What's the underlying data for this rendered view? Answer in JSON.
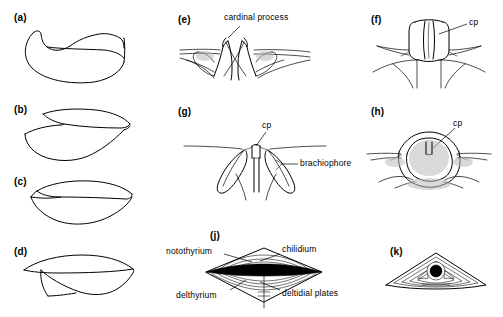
{
  "figure": {
    "domain": "scientific-line-illustration",
    "background_color": "#ffffff",
    "line_color": "#000000",
    "width": 503,
    "height": 317
  },
  "panels": [
    {
      "id": "a",
      "letter": "(a)",
      "description": "Lateral profile of strongly concavo-convex shell pair",
      "annotations": []
    },
    {
      "id": "b",
      "letter": "(b)",
      "description": "Lateral profile of shell pair with gaping commissure",
      "annotations": []
    },
    {
      "id": "c",
      "letter": "(c)",
      "description": "Lateral profile of thin biconvex shell pair",
      "annotations": []
    },
    {
      "id": "d",
      "letter": "(d)",
      "description": "Lateral profile of elongate shell pair with ventral flexure",
      "annotations": []
    },
    {
      "id": "e",
      "letter": "(e)",
      "description": "Interior posterior view of cardinalia with bilobed cardinal process",
      "annotations": [
        {
          "text": "cardinal process",
          "target": "cardinal-process"
        }
      ]
    },
    {
      "id": "f",
      "letter": "(f)",
      "description": "Interior posterior view, columnar bilobed cardinal process",
      "annotations": [
        {
          "text": "cp",
          "target": "cardinal-process"
        }
      ]
    },
    {
      "id": "g",
      "letter": "(g)",
      "description": "Interior posterior view with brachiophores flanking cardinal process",
      "annotations": [
        {
          "text": "cp",
          "target": "cardinal-process"
        },
        {
          "text": "brachiophore",
          "target": "brachiophore"
        }
      ]
    },
    {
      "id": "h",
      "letter": "(h)",
      "description": "Interior posterior view, shaded socket ridges enclosing cardinal process",
      "annotations": [
        {
          "text": "cp",
          "target": "cardinal-process"
        }
      ]
    },
    {
      "id": "j",
      "letter": "(j)",
      "description": "Posterior view of rhombic interarea with growth lines and median opening",
      "annotations": [
        {
          "text": "notothyrium",
          "target": "notothyrium"
        },
        {
          "text": "chilidium",
          "target": "chilidium"
        },
        {
          "text": "delthyrium",
          "target": "delthyrium"
        },
        {
          "text": "deltidial plates",
          "target": "deltidial-plates"
        }
      ]
    },
    {
      "id": "k",
      "letter": "(k)",
      "description": "Posterior view of low triangular interarea with circular foramen",
      "annotations": []
    }
  ],
  "labels": {
    "cardinal_process": "cardinal process",
    "cp": "cp",
    "brachiophore": "brachiophore",
    "notothyrium": "notothyrium",
    "chilidium": "chilidium",
    "delthyrium": "delthyrium",
    "deltidial_plates": "deltidial plates"
  },
  "letters": {
    "a": "(a)",
    "b": "(b)",
    "c": "(c)",
    "d": "(d)",
    "e": "(e)",
    "f": "(f)",
    "g": "(g)",
    "h": "(h)",
    "j": "(j)",
    "k": "(k)"
  }
}
